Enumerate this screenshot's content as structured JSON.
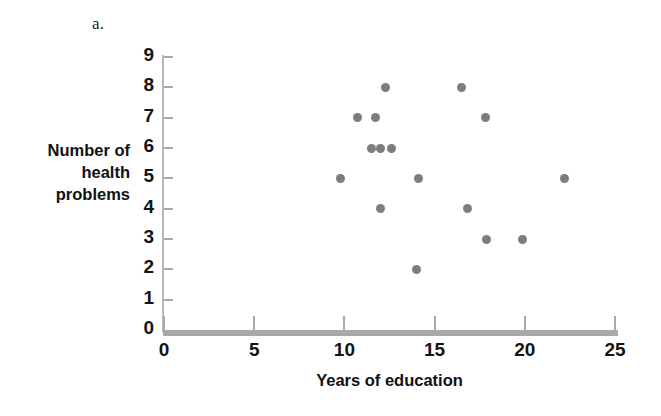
{
  "panel": {
    "letter": "a."
  },
  "colors": {
    "marker": "#7d7d7d",
    "axis": "#a9a9a9",
    "text": "#141414"
  },
  "chart_data": {
    "type": "scatter",
    "title": "",
    "subtitle": "",
    "xlabel": "Years of education",
    "ylabel": "Number of health problems",
    "ylabel_lines": [
      "Number of",
      "health",
      "problems"
    ],
    "xlim": [
      0,
      25
    ],
    "ylim": [
      0,
      9
    ],
    "xticks": [
      0,
      5,
      10,
      15,
      20,
      25
    ],
    "xtick_labels": [
      "0",
      "5",
      "10",
      "15",
      "20",
      "25"
    ],
    "yticks": [
      0,
      1,
      2,
      3,
      4,
      5,
      6,
      7,
      8,
      9
    ],
    "ytick_labels": [
      "0",
      "1",
      "2",
      "3",
      "4",
      "5",
      "6",
      "7",
      "8",
      "9"
    ],
    "grid": false,
    "legend": null,
    "marker_color": "#7d7d7d",
    "marker_size": 9,
    "points": [
      {
        "x": 9.8,
        "y": 5
      },
      {
        "x": 10.7,
        "y": 7
      },
      {
        "x": 11.5,
        "y": 6
      },
      {
        "x": 11.7,
        "y": 7
      },
      {
        "x": 12.0,
        "y": 6
      },
      {
        "x": 12.3,
        "y": 8
      },
      {
        "x": 12.0,
        "y": 4
      },
      {
        "x": 12.6,
        "y": 6
      },
      {
        "x": 14.1,
        "y": 5
      },
      {
        "x": 14.0,
        "y": 2
      },
      {
        "x": 16.5,
        "y": 8
      },
      {
        "x": 16.8,
        "y": 4
      },
      {
        "x": 17.8,
        "y": 7
      },
      {
        "x": 17.9,
        "y": 3
      },
      {
        "x": 19.9,
        "y": 3
      },
      {
        "x": 22.2,
        "y": 5
      }
    ]
  }
}
